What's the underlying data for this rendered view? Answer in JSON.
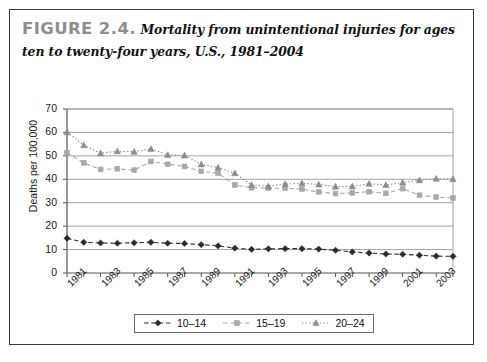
{
  "figure": {
    "number_label": "FIGURE 2.4.",
    "caption": "Mortality from unintentional injuries for ages ten to twenty-four years, U.S., 1981–2004"
  },
  "colors": {
    "series_10_14": "#2b2b2b",
    "series_15_19": "#a8a8a8",
    "series_20_24": "#8c8c8c",
    "gridline": "#9a9a9a",
    "axis": "#555555",
    "frame": "#3a3a3a",
    "figure_number": "#8e8e8e"
  },
  "chart_data": {
    "type": "line",
    "title": "Mortality from unintentional injuries for ages ten to twenty-four years, U.S., 1981–2004",
    "xlabel": "",
    "ylabel": "Deaths per 100,000",
    "ylim": [
      0,
      70
    ],
    "yticks": [
      0,
      10,
      20,
      30,
      40,
      50,
      60,
      70
    ],
    "grid": true,
    "legend_position": "bottom",
    "x": [
      1981,
      1982,
      1983,
      1984,
      1985,
      1986,
      1987,
      1988,
      1989,
      1990,
      1991,
      1992,
      1993,
      1994,
      1995,
      1996,
      1997,
      1998,
      1999,
      2000,
      2001,
      2002,
      2003,
      2004
    ],
    "xtick_labels": [
      "1981",
      "1983",
      "1985",
      "1987",
      "1989",
      "1991",
      "1993",
      "1995",
      "1997",
      "1999",
      "2001",
      "2003"
    ],
    "series": [
      {
        "name": "10–14",
        "marker": "diamond",
        "line_style": "dashed",
        "color": "#2b2b2b",
        "values": [
          14.8,
          13.1,
          12.8,
          12.7,
          12.9,
          13.1,
          12.7,
          12.6,
          12.1,
          11.6,
          10.6,
          10.1,
          10.3,
          10.4,
          10.4,
          10.2,
          9.7,
          9.0,
          8.5,
          8.1,
          8.0,
          7.6,
          7.2,
          7.1
        ]
      },
      {
        "name": "15–19",
        "marker": "square",
        "line_style": "dashed",
        "color": "#a8a8a8",
        "values": [
          51.3,
          47.0,
          44.2,
          44.5,
          43.9,
          47.6,
          46.4,
          45.5,
          43.4,
          42.6,
          37.6,
          36.4,
          36.2,
          36.2,
          35.8,
          34.6,
          33.9,
          34.2,
          34.7,
          34.0,
          36.0,
          33.2,
          32.4,
          32.0
        ]
      },
      {
        "name": "20–24",
        "marker": "triangle",
        "line_style": "dotted",
        "color": "#8c8c8c",
        "values": [
          60.1,
          54.6,
          51.1,
          52.0,
          51.8,
          53.0,
          50.4,
          50.2,
          46.4,
          45.0,
          42.6,
          37.6,
          37.0,
          38.0,
          38.3,
          37.8,
          36.9,
          37.0,
          38.1,
          37.6,
          38.6,
          39.6,
          40.3,
          40.1
        ]
      }
    ]
  },
  "legend": {
    "items": [
      "10–14",
      "15–19",
      "20–24"
    ]
  }
}
